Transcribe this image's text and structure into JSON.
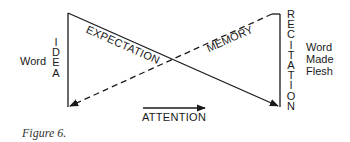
{
  "diagram": {
    "left_label": "Word",
    "left_vertical": "IDEA",
    "right_vertical": "RECITATION",
    "right_label_lines": [
      "Word",
      "Made",
      "Flesh"
    ],
    "diagonal_solid_label": "EXPECTATION",
    "diagonal_dashed_label": "MEMORY",
    "arrow_label": "ATTENTION",
    "caption": "Figure 6."
  }
}
